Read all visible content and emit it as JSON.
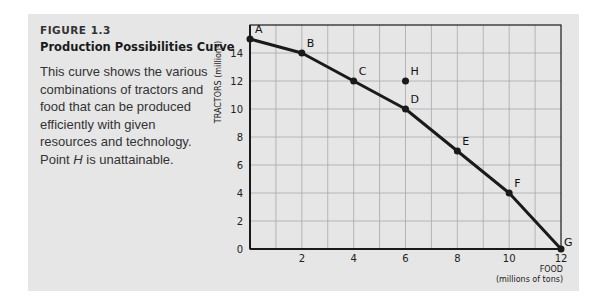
{
  "figure": {
    "number": "FIGURE 1.3",
    "title": "Production Possibilities Curve",
    "description_before_italic": "This curve shows the various combinations of tractors and food that can be produced efficiently with given resources and technology. Point ",
    "description_italic": "H",
    "description_after_italic": " is unattainable."
  },
  "colors": {
    "panel_background": "#e6e6e6",
    "curve": "#1a1a1a",
    "grid": "#a8a8a8",
    "axis": "#1a1a1a"
  },
  "chart_data": {
    "type": "line",
    "title": "Production Possibilities Curve",
    "xlabel": "FOOD (millions of tons)",
    "xlabel_line1": "FOOD",
    "xlabel_line2": "(millions of tons)",
    "ylabel": "TRACTORS (millions)",
    "xlim": [
      0,
      12
    ],
    "ylim": [
      0,
      16
    ],
    "x_ticks": [
      2,
      4,
      6,
      8,
      10,
      12
    ],
    "y_ticks": [
      0,
      2,
      4,
      6,
      8,
      10,
      12,
      14
    ],
    "grid": true,
    "x_grid_step": 1,
    "y_grid_step": 2,
    "series": [
      {
        "name": "Production possibilities curve",
        "points": [
          {
            "label": "A",
            "x": 0,
            "y": 15
          },
          {
            "label": "B",
            "x": 2,
            "y": 14
          },
          {
            "label": "C",
            "x": 4,
            "y": 12
          },
          {
            "label": "D",
            "x": 6,
            "y": 10
          },
          {
            "label": "E",
            "x": 8,
            "y": 7
          },
          {
            "label": "F",
            "x": 10,
            "y": 4
          },
          {
            "label": "G",
            "x": 12,
            "y": 0
          }
        ]
      }
    ],
    "annotations": [
      {
        "label": "H",
        "x": 6,
        "y": 12,
        "note": "unattainable point"
      }
    ]
  }
}
